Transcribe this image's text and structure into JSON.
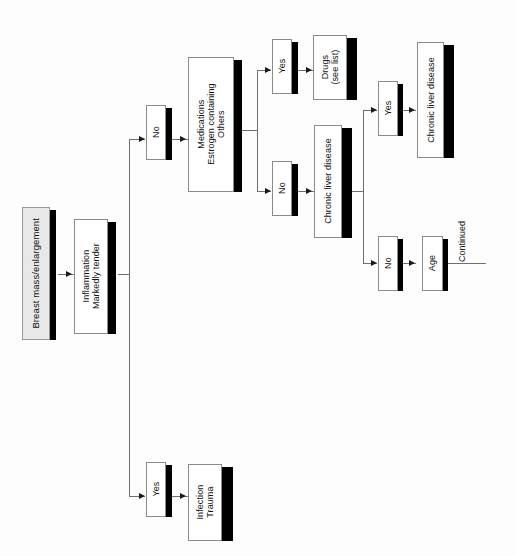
{
  "diagram": {
    "orientation": "left-to-right with vertically rotated text labels",
    "background_color": "#fdfdfd",
    "shadow_color": "#000000",
    "line_color": "#6f6f6f",
    "shaded_node_fill": "#e8e8e8"
  },
  "nodes": {
    "start": {
      "label": "Breast mass/enlargement",
      "style": "shaded"
    },
    "inflammation": {
      "line1": "Inflammation",
      "line2": "Markedly tender",
      "style": "plain"
    },
    "branch_no_1": {
      "label": "No"
    },
    "branch_yes_1": {
      "label": "Yes"
    },
    "medications": {
      "line1": "Medications",
      "line2": "Estrogen containing",
      "line3": "Others"
    },
    "meds_yes": {
      "label": "Yes"
    },
    "meds_no": {
      "label": "No"
    },
    "drugs": {
      "line1": "Drugs",
      "line2": "(see list)"
    },
    "chronic_liver_disease_q": {
      "label": "Chronic liver disease"
    },
    "cld_yes": {
      "label": "Yes"
    },
    "cld_no": {
      "label": "No"
    },
    "chronic_liver_disease_dx": {
      "label": "Chronic liver disease"
    },
    "age": {
      "label": "Age"
    },
    "infection_trauma": {
      "line1": "Infection",
      "line2": "Trauma"
    }
  },
  "annotations": {
    "continued": "Continued"
  }
}
